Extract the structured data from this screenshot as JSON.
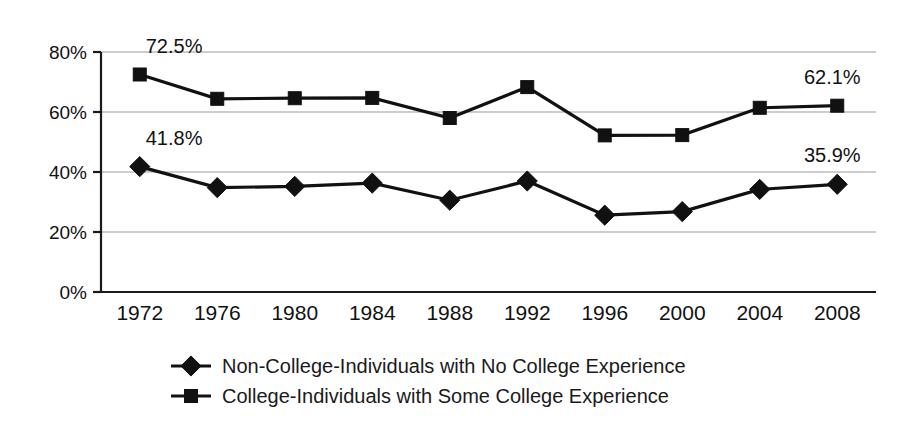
{
  "chart_data": {
    "type": "line",
    "title": "",
    "xlabel": "",
    "ylabel": "",
    "ylim": [
      0,
      80
    ],
    "yticks": [
      0,
      20,
      40,
      60,
      80
    ],
    "ytick_labels": [
      "0%",
      "20%",
      "40%",
      "60%",
      "80%"
    ],
    "grid": true,
    "legend_position": "bottom",
    "categories": [
      "1972",
      "1976",
      "1980",
      "1984",
      "1988",
      "1992",
      "1996",
      "2000",
      "2004",
      "2008"
    ],
    "series": [
      {
        "name": "Non-College-Individuals with No College Experience",
        "marker": "diamond",
        "values": [
          41.8,
          34.8,
          35.2,
          36.3,
          30.6,
          37.0,
          25.6,
          26.8,
          34.2,
          35.9
        ],
        "endpoint_labels": {
          "first": "41.8%",
          "last": "35.9%"
        }
      },
      {
        "name": "College-Individuals with Some College Experience",
        "marker": "square",
        "values": [
          72.5,
          64.4,
          64.6,
          64.7,
          58.0,
          68.3,
          52.2,
          52.3,
          61.4,
          62.1
        ],
        "endpoint_labels": {
          "first": "72.5%",
          "last": "62.1%"
        }
      }
    ],
    "annotations": [
      {
        "text": "72.5%",
        "series": "College-Individuals with Some College Experience",
        "category": "1972",
        "position": "above-left"
      },
      {
        "text": "41.8%",
        "series": "Non-College-Individuals with No College Experience",
        "category": "1972",
        "position": "above-left"
      },
      {
        "text": "62.1%",
        "series": "College-Individuals with Some College Experience",
        "category": "2008",
        "position": "above-left"
      },
      {
        "text": "35.9%",
        "series": "Non-College-Individuals with No College Experience",
        "category": "2008",
        "position": "above-left"
      }
    ],
    "colors": {
      "line": "#111111",
      "marker": "#111111",
      "gridline": "#9a9a9a",
      "axis": "#1a1a1a",
      "background": "#ffffff",
      "text": "#111111"
    }
  },
  "legend": {
    "entries": [
      {
        "label": "Non-College-Individuals with No College Experience",
        "marker": "diamond"
      },
      {
        "label": "College-Individuals with Some College Experience",
        "marker": "square"
      }
    ]
  }
}
